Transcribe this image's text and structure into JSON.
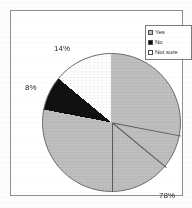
{
  "chart_data": {
    "type": "pie",
    "title": "",
    "categories": [
      "Yes",
      "No",
      "Not sure"
    ],
    "values": [
      78,
      8,
      14
    ],
    "value_labels": [
      "78%",
      "8%",
      "14%"
    ],
    "colors": [
      "#c0c0c0",
      "#111111",
      "#ffffff"
    ],
    "legend_position": "top-right",
    "start_angle_deg": 0,
    "direction": "clockwise",
    "grid": false
  },
  "legend": {
    "items": [
      {
        "label": "Yes",
        "swatch": "#c0c0c0",
        "swatch_icon": "legend-swatch-gray"
      },
      {
        "label": "No",
        "swatch": "#111111",
        "swatch_icon": "legend-swatch-black"
      },
      {
        "label": "Not sure",
        "swatch": "#ffffff",
        "swatch_icon": "legend-swatch-white"
      }
    ]
  },
  "labels": {
    "not_sure_pct": "14%",
    "no_pct": "8%",
    "yes_pct": "78%"
  },
  "colors": {
    "yes_slice": "#c0c0c0",
    "no_slice": "#111111",
    "not_sure_slice": "#ffffff",
    "frame_border": "#8d8d8d",
    "page_background": "#ffffff",
    "text": "#2b2b2b"
  }
}
